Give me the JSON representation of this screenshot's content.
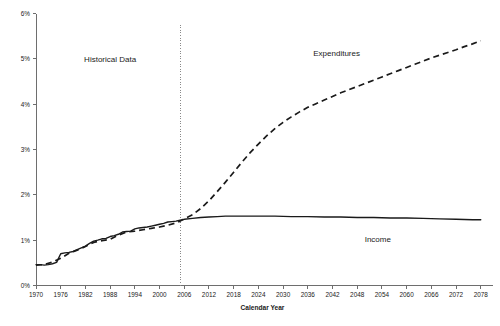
{
  "chart_data": {
    "type": "line",
    "title": "",
    "xlabel": "Calendar Year",
    "ylabel": "",
    "xlim": [
      1970,
      2080
    ],
    "ylim": [
      0,
      6
    ],
    "grid": false,
    "legend_position": "inline-annotations",
    "x_tick_labels": [
      "1970",
      "1976",
      "1982",
      "1988",
      "1994",
      "2000",
      "2006",
      "2012",
      "2018",
      "2024",
      "2030",
      "2036",
      "2042",
      "2048",
      "2054",
      "2060",
      "2066",
      "2072",
      "2078"
    ],
    "x_tick_values": [
      1970,
      1976,
      1982,
      1988,
      1994,
      2000,
      2006,
      2012,
      2018,
      2024,
      2030,
      2036,
      2042,
      2048,
      2054,
      2060,
      2066,
      2072,
      2078
    ],
    "y_tick_labels": [
      "0%",
      "1%",
      "2%",
      "3%",
      "4%",
      "5%",
      "6%"
    ],
    "y_tick_values": [
      0,
      1,
      2,
      3,
      4,
      5,
      6
    ],
    "annotations": [
      {
        "text": "Historical Data",
        "x": 1988,
        "y": 4.93
      },
      {
        "text": "Expenditures",
        "x": 2043,
        "y": 5.06
      },
      {
        "text": "Income",
        "x": 2053,
        "y": 0.96
      }
    ],
    "divider": {
      "label": "",
      "x": 2005,
      "style": "dotted-vertical"
    },
    "series": [
      {
        "name": "Income",
        "style": "solid",
        "x": [
          1970,
          1971,
          1972,
          1973,
          1974,
          1975,
          1976,
          1977,
          1978,
          1979,
          1980,
          1981,
          1982,
          1983,
          1984,
          1985,
          1986,
          1987,
          1988,
          1989,
          1990,
          1991,
          1992,
          1993,
          1994,
          1995,
          1996,
          1997,
          1998,
          1999,
          2000,
          2001,
          2002,
          2003,
          2004,
          2005,
          2006,
          2008,
          2010,
          2012,
          2014,
          2016,
          2018,
          2020,
          2024,
          2028,
          2032,
          2036,
          2040,
          2044,
          2048,
          2052,
          2056,
          2060,
          2064,
          2068,
          2072,
          2076,
          2078
        ],
        "values": [
          0.46,
          0.46,
          0.45,
          0.46,
          0.48,
          0.51,
          0.7,
          0.72,
          0.73,
          0.75,
          0.79,
          0.83,
          0.87,
          0.93,
          0.98,
          1.0,
          1.03,
          1.04,
          1.08,
          1.1,
          1.13,
          1.18,
          1.19,
          1.2,
          1.25,
          1.27,
          1.28,
          1.29,
          1.31,
          1.33,
          1.35,
          1.37,
          1.4,
          1.41,
          1.42,
          1.44,
          1.46,
          1.48,
          1.5,
          1.51,
          1.52,
          1.53,
          1.53,
          1.53,
          1.53,
          1.53,
          1.52,
          1.52,
          1.51,
          1.51,
          1.5,
          1.5,
          1.49,
          1.49,
          1.48,
          1.47,
          1.46,
          1.45,
          1.45
        ]
      },
      {
        "name": "Expenditures",
        "style": "dashed",
        "x": [
          1970,
          1972,
          1974,
          1976,
          1978,
          1980,
          1982,
          1984,
          1986,
          1988,
          1990,
          1992,
          1994,
          1996,
          1998,
          2000,
          2002,
          2004,
          2005,
          2006,
          2008,
          2010,
          2012,
          2014,
          2016,
          2018,
          2020,
          2022,
          2024,
          2026,
          2028,
          2030,
          2032,
          2034,
          2036,
          2038,
          2040,
          2042,
          2044,
          2046,
          2048,
          2050,
          2052,
          2054,
          2056,
          2058,
          2060,
          2062,
          2064,
          2066,
          2068,
          2070,
          2072,
          2074,
          2076,
          2078
        ],
        "values": [
          0.45,
          0.46,
          0.52,
          0.6,
          0.71,
          0.78,
          0.86,
          0.95,
          0.99,
          1.02,
          1.11,
          1.18,
          1.2,
          1.23,
          1.26,
          1.29,
          1.33,
          1.38,
          1.42,
          1.47,
          1.56,
          1.7,
          1.87,
          2.07,
          2.28,
          2.5,
          2.72,
          2.93,
          3.12,
          3.3,
          3.46,
          3.6,
          3.72,
          3.83,
          3.93,
          4.01,
          4.09,
          4.17,
          4.25,
          4.32,
          4.39,
          4.46,
          4.53,
          4.6,
          4.67,
          4.74,
          4.81,
          4.88,
          4.95,
          5.02,
          5.08,
          5.14,
          5.2,
          5.27,
          5.33,
          5.4
        ]
      }
    ]
  },
  "colors": {
    "line": "#1a1a1a",
    "axis": "#6e6e6e",
    "divider": "#8a8a8a",
    "background": "#ffffff"
  }
}
